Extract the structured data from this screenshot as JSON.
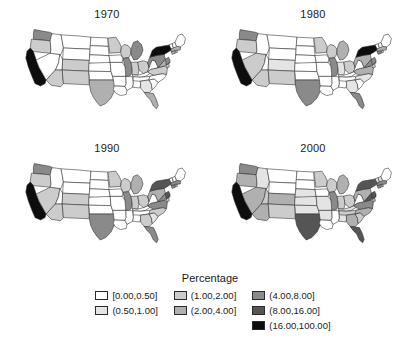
{
  "figure": {
    "type": "choropleth-map-series",
    "panels": [
      {
        "title": "1970"
      },
      {
        "title": "1980"
      },
      {
        "title": "1990"
      },
      {
        "title": "2000"
      }
    ]
  },
  "legend": {
    "title": "Percentage",
    "columns": [
      [
        {
          "label": "[0.00,0.50]",
          "color": "#ffffff"
        },
        {
          "label": "(0.50,1.00]",
          "color": "#e4e4e4"
        }
      ],
      [
        {
          "label": "(1.00,2.00]",
          "color": "#cccccc"
        },
        {
          "label": "(2.00,4.00]",
          "color": "#b0b0b0"
        }
      ],
      [
        {
          "label": "(4.00,8.00]",
          "color": "#8a8a8a"
        },
        {
          "label": "(8.00,16.00]",
          "color": "#555555"
        },
        {
          "label": "(16.00,100.00]",
          "color": "#0d0d0d"
        }
      ]
    ]
  },
  "chart_data": {
    "type": "heatmap",
    "title": "",
    "subtitle": "",
    "legend_title": "Percentage",
    "legend_position": "bottom-center",
    "panel_titles": [
      "1970",
      "1980",
      "1990",
      "2000"
    ],
    "class_breaks": [
      0.0,
      0.5,
      1.0,
      2.0,
      4.0,
      8.0,
      16.0,
      100.0
    ],
    "class_labels": [
      "[0.00,0.50]",
      "(0.50,1.00]",
      "(1.00,2.00]",
      "(2.00,4.00]",
      "(4.00,8.00]",
      "(8.00,16.00]",
      "(16.00,100.00]"
    ],
    "class_colors": [
      "#ffffff",
      "#e4e4e4",
      "#cccccc",
      "#b0b0b0",
      "#8a8a8a",
      "#555555",
      "#0d0d0d"
    ],
    "series": [
      {
        "name": "1970",
        "values": {
          "WA": 4,
          "OR": 2,
          "CA": 6,
          "NV": 0,
          "ID": 0,
          "MT": 0,
          "WY": 0,
          "UT": 0,
          "AZ": 2,
          "NM": 2,
          "CO": 2,
          "ND": 0,
          "SD": 0,
          "NE": 0,
          "KS": 0,
          "OK": 0,
          "TX": 3,
          "MN": 2,
          "IA": 0,
          "MO": 0,
          "AR": 0,
          "LA": 0,
          "WI": 2,
          "IL": 4,
          "MS": 0,
          "AL": 0,
          "MI": 4,
          "IN": 2,
          "KY": 0,
          "TN": 0,
          "OH": 2,
          "GA": 1,
          "FL": 3,
          "SC": 0,
          "NC": 0,
          "VA": 2,
          "WV": 0,
          "PA": 4,
          "NY": 6,
          "MD": 3,
          "DE": 2,
          "NJ": 4,
          "CT": 3,
          "RI": 2,
          "MA": 3,
          "VT": 0,
          "NH": 0,
          "ME": 0
        }
      },
      {
        "name": "1980",
        "values": {
          "WA": 4,
          "OR": 2,
          "CA": 6,
          "NV": 2,
          "ID": 0,
          "MT": 0,
          "WY": 0,
          "UT": 0,
          "AZ": 2,
          "NM": 2,
          "CO": 1,
          "ND": 0,
          "SD": 0,
          "NE": 0,
          "KS": 0,
          "OK": 0,
          "TX": 4,
          "MN": 2,
          "IA": 0,
          "MO": 0,
          "AR": 0,
          "LA": 0,
          "WI": 2,
          "IL": 4,
          "MS": 0,
          "AL": 0,
          "MI": 3,
          "IN": 1,
          "KY": 0,
          "TN": 0,
          "OH": 2,
          "GA": 1,
          "FL": 4,
          "SC": 0,
          "NC": 1,
          "VA": 3,
          "WV": 0,
          "PA": 3,
          "NY": 6,
          "MD": 4,
          "DE": 2,
          "NJ": 4,
          "CT": 4,
          "RI": 2,
          "MA": 3,
          "VT": 0,
          "NH": 0,
          "ME": 0
        }
      },
      {
        "name": "1990",
        "values": {
          "WA": 4,
          "OR": 2,
          "CA": 6,
          "NV": 2,
          "ID": 0,
          "MT": 0,
          "WY": 0,
          "UT": 0,
          "AZ": 2,
          "NM": 2,
          "CO": 2,
          "ND": 0,
          "SD": 0,
          "NE": 0,
          "KS": 0,
          "OK": 0,
          "TX": 4,
          "MN": 2,
          "IA": 0,
          "MO": 0,
          "AR": 0,
          "LA": 0,
          "WI": 2,
          "IL": 4,
          "MS": 0,
          "AL": 0,
          "MI": 3,
          "IN": 2,
          "KY": 0,
          "TN": 0,
          "OH": 2,
          "GA": 2,
          "FL": 4,
          "SC": 1,
          "NC": 2,
          "VA": 4,
          "WV": 0,
          "PA": 3,
          "NY": 5,
          "MD": 4,
          "DE": 2,
          "NJ": 5,
          "CT": 4,
          "RI": 2,
          "MA": 4,
          "VT": 0,
          "NH": 0,
          "ME": 0
        }
      },
      {
        "name": "2000",
        "values": {
          "WA": 4,
          "OR": 3,
          "CA": 6,
          "NV": 3,
          "ID": 1,
          "MT": 0,
          "WY": 0,
          "UT": 2,
          "AZ": 3,
          "NM": 2,
          "CO": 3,
          "ND": 0,
          "SD": 0,
          "NE": 1,
          "KS": 1,
          "OK": 1,
          "TX": 5,
          "MN": 2,
          "IA": 0,
          "MO": 1,
          "AR": 1,
          "LA": 0,
          "WI": 2,
          "IL": 4,
          "MS": 0,
          "AL": 1,
          "MI": 3,
          "IN": 2,
          "KY": 1,
          "TN": 2,
          "OH": 2,
          "GA": 3,
          "FL": 5,
          "SC": 2,
          "NC": 3,
          "VA": 4,
          "WV": 0,
          "PA": 3,
          "NY": 5,
          "MD": 5,
          "DE": 3,
          "NJ": 5,
          "CT": 4,
          "RI": 3,
          "MA": 4,
          "VT": 1,
          "NH": 1,
          "ME": 0
        }
      }
    ]
  }
}
